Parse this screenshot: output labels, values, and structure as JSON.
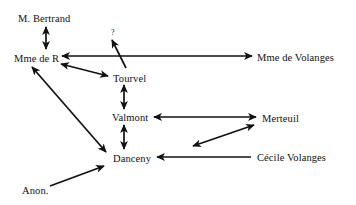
{
  "diagram": {
    "type": "directed-graph",
    "background_color": "#ffffff",
    "line_color": "#111111",
    "text_color": "#111111",
    "nodes": [
      {
        "id": "bertrand",
        "label": "M. Bertrand",
        "x": 18,
        "y": 18
      },
      {
        "id": "mme_de_r",
        "label": "Mme de R",
        "x": 14,
        "y": 58
      },
      {
        "id": "qmark",
        "label": "?",
        "x": 111,
        "y": 33
      },
      {
        "id": "tourvel",
        "label": "Tourvel",
        "x": 113,
        "y": 78
      },
      {
        "id": "volanges",
        "label": "Mme de Volanges",
        "x": 257,
        "y": 57
      },
      {
        "id": "valmont",
        "label": "Valmont",
        "x": 112,
        "y": 117
      },
      {
        "id": "merteuil",
        "label": "Merteuil",
        "x": 262,
        "y": 118
      },
      {
        "id": "danceny",
        "label": "Danceny",
        "x": 113,
        "y": 158
      },
      {
        "id": "cecile",
        "label": "Cécile Volanges",
        "x": 257,
        "y": 157
      },
      {
        "id": "anon",
        "label": "Anon.",
        "x": 22,
        "y": 190
      }
    ],
    "edges": [
      {
        "id": "e-bertrand-mmeder",
        "from": "bertrand",
        "to": "mme_de_r",
        "direction": "both",
        "shape": "vertical",
        "x1": 46,
        "y1": 27,
        "x2": 46,
        "y2": 49
      },
      {
        "id": "e-mmeder-volanges",
        "from": "mme_de_r",
        "to": "volanges",
        "direction": "both",
        "shape": "horizontal",
        "x1": 62,
        "y1": 56,
        "x2": 252,
        "y2": 56
      },
      {
        "id": "e-tourvel-qmark",
        "from": "tourvel",
        "to": "qmark",
        "direction": "forward",
        "shape": "diagonal",
        "x1": 126,
        "y1": 68,
        "x2": 112,
        "y2": 40
      },
      {
        "id": "e-mmeder-tourvel",
        "from": "mme_de_r",
        "to": "tourvel",
        "direction": "both",
        "shape": "diagonal",
        "x1": 61,
        "y1": 64,
        "x2": 108,
        "y2": 76
      },
      {
        "id": "e-tourvel-valmont",
        "from": "tourvel",
        "to": "valmont",
        "direction": "both",
        "shape": "vertical",
        "x1": 124,
        "y1": 85,
        "x2": 124,
        "y2": 109
      },
      {
        "id": "e-valmont-danceny",
        "from": "valmont",
        "to": "danceny",
        "direction": "both",
        "shape": "vertical",
        "x1": 124,
        "y1": 125,
        "x2": 124,
        "y2": 149
      },
      {
        "id": "e-valmont-merteuil",
        "from": "valmont",
        "to": "merteuil",
        "direction": "both",
        "shape": "horizontal",
        "x1": 154,
        "y1": 117,
        "x2": 256,
        "y2": 117
      },
      {
        "id": "e-merteuil-danceny",
        "from": "merteuil",
        "to": "danceny",
        "direction": "both",
        "shape": "diagonal",
        "x1": 254,
        "y1": 125,
        "x2": 193,
        "y2": 146
      },
      {
        "id": "e-cecile-danceny",
        "from": "cecile",
        "to": "danceny",
        "direction": "forward",
        "shape": "horizontal",
        "x1": 251,
        "y1": 157,
        "x2": 157,
        "y2": 157
      },
      {
        "id": "e-anon-danceny",
        "from": "anon",
        "to": "danceny",
        "direction": "forward",
        "shape": "diagonal",
        "x1": 50,
        "y1": 186,
        "x2": 104,
        "y2": 166
      },
      {
        "id": "e-mmeder-danceny",
        "from": "mme_de_r",
        "to": "danceny",
        "direction": "both",
        "shape": "diagonal",
        "x1": 32,
        "y1": 67,
        "x2": 106,
        "y2": 152
      }
    ]
  }
}
